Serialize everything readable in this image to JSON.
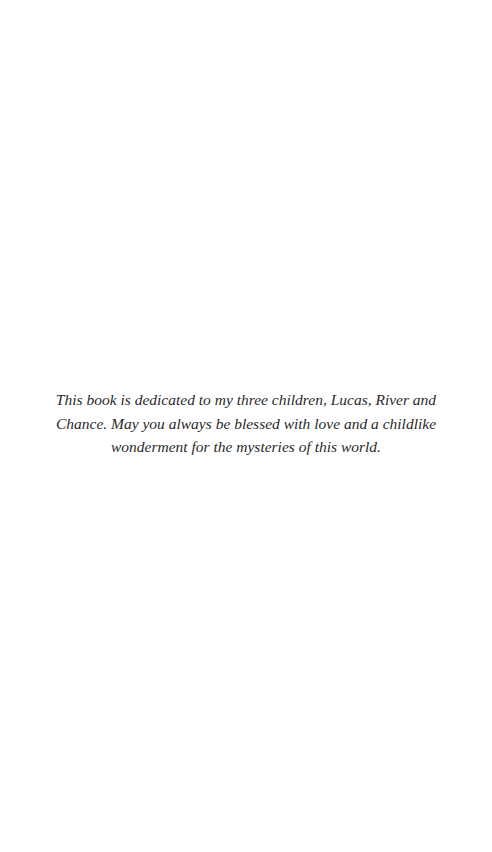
{
  "page": {
    "background": "#ffffff",
    "dedication": {
      "text": "This book is dedicated to my three children, Lucas, River and Chance. May you always be blessed with love and a childlike wonderment for the mysteries of this world.",
      "color": "#2a2a2a"
    }
  }
}
